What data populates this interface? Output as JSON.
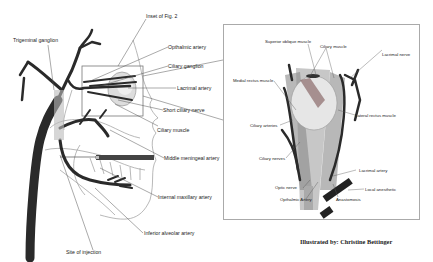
{
  "figure": {
    "left_panel": {
      "labels": {
        "inset_ref": "Inset of Fig. 2",
        "trigeminal_ganglion": "Trigeminal ganglion",
        "opthalmic_artery": "Opthalmic artery",
        "ciliary_ganglion": "Ciliary ganglion",
        "lacrimal_artery": "Lacrimal artery",
        "short_ciliary_nerve": "Short ciliary nerve",
        "ciliary_muscle": "Ciliary muscle",
        "middle_meningeal_artery": "Middle meningeal artery",
        "internal_maxillary_artery": "Internal maxillary artery",
        "inferior_alveolar_artery": "Inferior alveolar artery",
        "site_of_injection": "Site of injection"
      }
    },
    "inset_panel": {
      "labels": {
        "superior_oblique_muscle": "Superior oblique muscle",
        "ciliary_muscle": "Ciliary muscle",
        "lacrimal_nerve": "Lacrimal nerve",
        "medial_rectus_muscle": "Medial rectus muscle",
        "lateral_rectus_muscle": "Lateral rectus muscle",
        "ciliary_arteries": "Ciliary arteries",
        "ciliary_nerves": "Ciliary nerves",
        "lacrimal_artery": "Lacrimal artery",
        "local_anesthetic": "Local anesthetic",
        "optic_nerve": "Optic nerve",
        "opthalmic_artery": "Opthalmic Artery",
        "anastomosis": "Anastomosis"
      }
    },
    "credit": "Illustrated by:  Christine Bettinger"
  }
}
